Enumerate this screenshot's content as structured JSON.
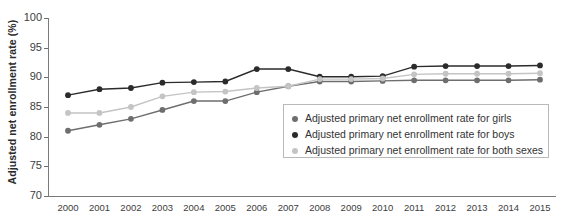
{
  "chart_data": {
    "type": "line",
    "title": "",
    "xlabel": "",
    "ylabel": "Adjusted net enrollment rate (%)",
    "ylim": [
      70,
      100
    ],
    "yticks": [
      70,
      75,
      80,
      85,
      90,
      95,
      100
    ],
    "grid": false,
    "legend_position": "inside-right-lower",
    "categories": [
      "2000",
      "2001",
      "2002",
      "2003",
      "2004",
      "2005",
      "2006",
      "2007",
      "2008",
      "2009",
      "2010",
      "2011",
      "2012",
      "2013",
      "2014",
      "2015"
    ],
    "series": [
      {
        "name": "Adjusted primary net enrollment rate for girls",
        "color": "#6e6e6e",
        "values": [
          81.0,
          82.0,
          83.0,
          84.5,
          86.0,
          86.0,
          87.5,
          88.5,
          89.3,
          89.3,
          89.4,
          89.5,
          89.5,
          89.5,
          89.5,
          89.6
        ]
      },
      {
        "name": "Adjusted primary net enrollment rate for boys",
        "color": "#2b2b2b",
        "values": [
          87.0,
          88.0,
          88.2,
          89.1,
          89.2,
          89.3,
          91.4,
          91.4,
          90.1,
          90.1,
          90.2,
          91.8,
          91.9,
          91.9,
          91.9,
          92.0
        ]
      },
      {
        "name": "Adjusted primary net enrollment rate for both sexes",
        "color": "#c4c4c4",
        "values": [
          84.0,
          84.0,
          85.0,
          86.8,
          87.5,
          87.6,
          88.2,
          88.5,
          89.7,
          89.7,
          89.8,
          90.5,
          90.6,
          90.6,
          90.6,
          90.7
        ]
      }
    ]
  },
  "legend": {
    "items": [
      {
        "label": "Adjusted primary net enrollment rate for girls",
        "color": "#6e6e6e"
      },
      {
        "label": "Adjusted primary net enrollment rate for boys",
        "color": "#2b2b2b"
      },
      {
        "label": "Adjusted primary net enrollment rate for both sexes",
        "color": "#c4c4c4"
      }
    ]
  }
}
